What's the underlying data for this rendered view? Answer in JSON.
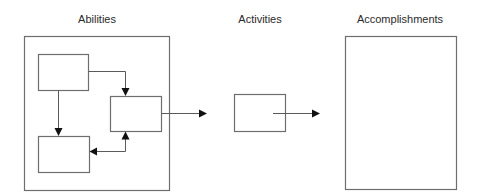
{
  "diagram": {
    "title_labels": {
      "abilities": "Abilities",
      "activities": "Activities",
      "accomplishments": "Accomplishments"
    },
    "colors": {
      "background": "#ffffff",
      "box_stroke": "#6e6e6e",
      "connector_stroke": "#5a5a5a",
      "arrowhead": "#111111",
      "text": "#2a2a2a"
    },
    "nodes": [
      {
        "id": "abilities-container",
        "label": "Abilities",
        "x": 24,
        "y": 36,
        "w": 145,
        "h": 154
      },
      {
        "id": "ability-box-top-left",
        "label": "",
        "x": 38,
        "y": 54,
        "w": 50,
        "h": 36
      },
      {
        "id": "ability-box-right",
        "label": "",
        "x": 110,
        "y": 96,
        "w": 51,
        "h": 35
      },
      {
        "id": "ability-box-bottom-left",
        "label": "",
        "x": 38,
        "y": 136,
        "w": 51,
        "h": 36
      },
      {
        "id": "activities-box",
        "label": "Activities",
        "x": 234,
        "y": 94,
        "w": 51,
        "h": 37
      },
      {
        "id": "accomplishments-box",
        "label": "Accomplishments",
        "x": 345,
        "y": 36,
        "w": 111,
        "h": 153
      }
    ],
    "edges": [
      {
        "from": "ability-box-top-left",
        "to": "ability-box-right",
        "type": "elbow-arrow"
      },
      {
        "from": "ability-box-top-left",
        "to": "ability-box-bottom-left",
        "type": "arrow"
      },
      {
        "from": "ability-box-right",
        "to": "ability-box-bottom-left",
        "type": "bidirectional-elbow-arrow"
      },
      {
        "from": "ability-box-right",
        "to": "activities-box",
        "type": "arrow"
      },
      {
        "from": "activities-box",
        "to": "accomplishments-box",
        "type": "arrow"
      }
    ]
  }
}
